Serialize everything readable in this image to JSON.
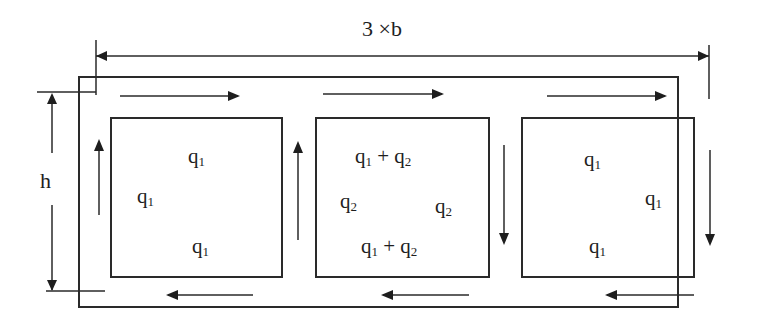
{
  "diagram": {
    "width_label": "3 ×b",
    "height_label": "h",
    "cells": [
      {
        "id": "cell-1",
        "top": {
          "base": "q",
          "sub": "1"
        },
        "left": {
          "base": "q",
          "sub": "1"
        },
        "bottom": {
          "base": "q",
          "sub": "1"
        }
      },
      {
        "id": "cell-2",
        "top": {
          "a": "q",
          "a_sub": "1",
          "op": "+",
          "b": "q",
          "b_sub": "2"
        },
        "left": {
          "base": "q",
          "sub": "2"
        },
        "right": {
          "base": "q",
          "sub": "2"
        },
        "bottom": {
          "a": "q",
          "a_sub": "1",
          "op": "+",
          "b": "q",
          "b_sub": "2"
        }
      },
      {
        "id": "cell-3",
        "top": {
          "base": "q",
          "sub": "1"
        },
        "right": {
          "base": "q",
          "sub": "1"
        },
        "bottom": {
          "base": "q",
          "sub": "1"
        }
      }
    ],
    "flow_arrows": {
      "top": [
        "right",
        "right",
        "right"
      ],
      "bottom": [
        "left",
        "left",
        "left"
      ],
      "webs": [
        "up",
        "up",
        "down",
        "down"
      ]
    },
    "colors": {
      "line": "#2a2a2a",
      "background": "#ffffff"
    }
  }
}
